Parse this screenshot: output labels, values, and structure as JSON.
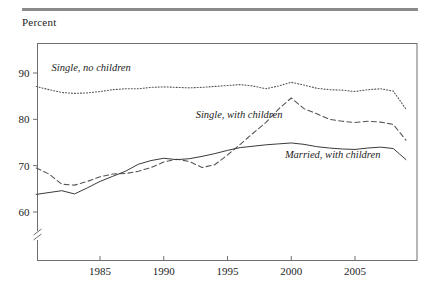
{
  "figure": {
    "axis_title": "Percent",
    "top_rule_color": "#8a8a8a"
  },
  "chart_data": {
    "type": "line",
    "title": "",
    "xlabel": "",
    "ylabel": "Percent",
    "xlim": [
      1980,
      2009
    ],
    "ylim": [
      57,
      95
    ],
    "y_axis_break": true,
    "grid": false,
    "legend_position": "inline-annotations",
    "xticks": [
      1985,
      1990,
      1995,
      2000,
      2005
    ],
    "xtick_labels": [
      "1985",
      "1990",
      "1995",
      "2000",
      "2005"
    ],
    "yticks": [
      60,
      70,
      80,
      90
    ],
    "ytick_labels": [
      "60",
      "70",
      "80",
      "90"
    ],
    "x": [
      1980,
      1981,
      1982,
      1983,
      1984,
      1985,
      1986,
      1987,
      1988,
      1989,
      1990,
      1991,
      1992,
      1993,
      1994,
      1995,
      1996,
      1997,
      1998,
      1999,
      2000,
      2001,
      2002,
      2003,
      2004,
      2005,
      2006,
      2007,
      2008,
      2009
    ],
    "series": [
      {
        "name": "Single, no children",
        "label": "Single, no children",
        "style": "dotted",
        "color": "#555555",
        "label_x": 1981.2,
        "label_y": 90.4,
        "values": [
          87.1,
          86.4,
          85.8,
          85.6,
          85.7,
          86.0,
          86.4,
          86.6,
          86.6,
          86.9,
          87.0,
          86.9,
          86.8,
          86.9,
          87.1,
          87.3,
          87.5,
          87.2,
          86.6,
          87.2,
          88.0,
          87.4,
          86.7,
          86.4,
          86.3,
          86.0,
          86.4,
          86.6,
          86.1,
          82.2
        ]
      },
      {
        "name": "Single, with children",
        "label": "Single, with children",
        "style": "dashed",
        "color": "#555555",
        "label_x": 1992.5,
        "label_y": 80.3,
        "values": [
          69.5,
          68.2,
          66.0,
          65.8,
          66.6,
          67.6,
          68.2,
          68.3,
          68.8,
          69.6,
          70.8,
          71.4,
          70.9,
          69.6,
          70.2,
          72.3,
          74.6,
          77.0,
          79.3,
          82.2,
          84.6,
          82.3,
          81.2,
          80.0,
          79.6,
          79.3,
          79.6,
          79.4,
          78.9,
          75.5
        ]
      },
      {
        "name": "Married, with children",
        "label": "Married, with children",
        "style": "solid",
        "color": "#3a3a3a",
        "label_x": 1999.5,
        "label_y": 71.6,
        "values": [
          63.8,
          64.2,
          64.6,
          63.9,
          65.2,
          66.6,
          67.7,
          68.8,
          70.3,
          71.1,
          71.6,
          71.3,
          71.5,
          72.0,
          72.6,
          73.3,
          73.9,
          74.2,
          74.5,
          74.7,
          74.9,
          74.6,
          74.1,
          73.8,
          73.6,
          73.5,
          73.8,
          74.0,
          73.7,
          71.3
        ]
      }
    ]
  }
}
